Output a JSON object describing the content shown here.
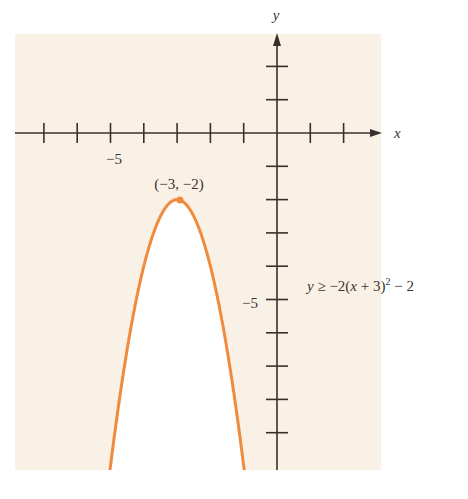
{
  "chart_data": {
    "type": "line",
    "title": "",
    "xlabel": "x",
    "ylabel": "y",
    "xlim": [
      -7.5,
      2
    ],
    "ylim": [
      -10,
      2.6
    ],
    "x_tick_step": 1,
    "y_tick_step": 1,
    "x_tick_labels": [
      {
        "value": -5,
        "label": "−5"
      }
    ],
    "y_tick_labels": [
      {
        "value": -5,
        "label": "−5"
      }
    ],
    "grid": false,
    "series": [
      {
        "name": "y ≥ −2(x + 3)² − 2",
        "equation": "y = -2(x+3)^2 - 2",
        "color": "#f08a3c",
        "shading": "region above curve shaded; interior below vertex unshaded",
        "x": [
          -5.0,
          -4.5,
          -4.0,
          -3.5,
          -3.0,
          -2.5,
          -2.0,
          -1.5,
          -1.0
        ],
        "y": [
          -10,
          -6.5,
          -4.0,
          -2.5,
          -2.0,
          -2.5,
          -4.0,
          -6.5,
          -10
        ]
      }
    ],
    "annotations": [
      {
        "text": "(−3, −2)",
        "x": -3,
        "y": -2,
        "marker": true
      },
      {
        "text": "y ≥ −2(x + 3)² − 2",
        "position": "right of y-axis near y=−4.5"
      }
    ],
    "colors": {
      "shade": "#faf1e6",
      "curve": "#f08a3c",
      "axis": "#3a2e2c"
    }
  },
  "labels": {
    "x_axis": "x",
    "y_axis": "y",
    "x_tick_minus5": "−5",
    "y_tick_minus5": "−5",
    "vertex": "(−3, −2)",
    "inequality_prefix": "y ≥ −2(x + 3)",
    "inequality_exp": "2",
    "inequality_suffix": " − 2"
  }
}
